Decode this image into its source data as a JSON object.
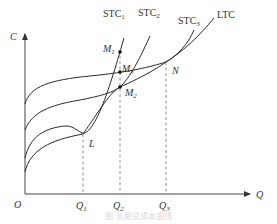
{
  "axes": {
    "y_label": "C",
    "x_label": "Q",
    "origin_label": "O",
    "x_ticks": [
      {
        "main": "Q",
        "sub": "1"
      },
      {
        "main": "Q",
        "sub": "2"
      },
      {
        "main": "Q",
        "sub": "3"
      }
    ]
  },
  "curves": [
    {
      "main": "STC",
      "sub": "1"
    },
    {
      "main": "STC",
      "sub": "2"
    },
    {
      "main": "STC",
      "sub": "3"
    },
    {
      "main": "LTC",
      "sub": ""
    }
  ],
  "points": [
    {
      "main": "M",
      "sub": "1"
    },
    {
      "main": "M",
      "sub": "3"
    },
    {
      "main": "M",
      "sub": "2"
    },
    {
      "main": "L",
      "sub": ""
    },
    {
      "main": "N",
      "sub": ""
    }
  ],
  "caption": "图 长期总成本曲线",
  "colors": {
    "line": "#2a2a2a",
    "dash": "#777777",
    "text": "#333333"
  }
}
